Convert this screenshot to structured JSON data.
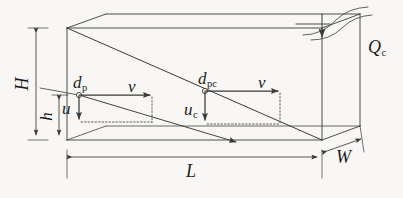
{
  "figure": {
    "kind": "engineering-schematic",
    "background_color": "#f8f7f5",
    "line_color": "#3a3a38",
    "text_color": "#1c1c1c"
  },
  "dimensions": {
    "height_total": {
      "symbol": "H",
      "description": "total basin height"
    },
    "height_partial": {
      "symbol": "h",
      "description": "settling depth"
    },
    "length": {
      "symbol": "L",
      "description": "basin length"
    },
    "width": {
      "symbol": "W",
      "description": "basin width"
    }
  },
  "flow": {
    "overflow": {
      "symbol": "Q",
      "subscript": "c",
      "description": "critical overflow rate"
    }
  },
  "vectors": {
    "particle": {
      "diameter": {
        "symbol": "d",
        "subscript": "p",
        "description": "particle diameter"
      },
      "horizontal": {
        "symbol": "v",
        "subscript": "",
        "description": "horizontal flow velocity"
      },
      "vertical": {
        "symbol": "u",
        "subscript": "",
        "description": "particle settling velocity"
      }
    },
    "critical_particle": {
      "diameter": {
        "symbol": "d",
        "subscript": "pc",
        "description": "critical particle diameter"
      },
      "horizontal": {
        "symbol": "v",
        "subscript": "",
        "description": "horizontal flow velocity"
      },
      "vertical": {
        "symbol": "u",
        "subscript": "c",
        "description": "critical settling velocity"
      }
    }
  },
  "labels": {
    "H": "H",
    "h": "h",
    "L": "L",
    "W": "W",
    "Q": "Q",
    "Q_sub": "c",
    "d": "d",
    "dp_sub": "p",
    "dpc_sub": "pc",
    "v": "v",
    "u": "u",
    "uc_sub": "c"
  }
}
